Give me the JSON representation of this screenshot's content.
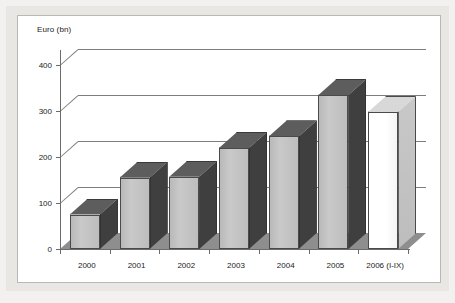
{
  "chart_data": {
    "type": "bar",
    "title": "",
    "subtitle": "",
    "xlabel": "",
    "ylabel": "Euro (bn)",
    "categories": [
      "2000",
      "2001",
      "2002",
      "2003",
      "2004",
      "2005",
      "2006 (I-IX)"
    ],
    "values": [
      75,
      155,
      157,
      220,
      245,
      335,
      298
    ],
    "series": [
      {
        "name": "Euro (bn)",
        "values": [
          75,
          155,
          157,
          220,
          245,
          335,
          298
        ]
      }
    ],
    "ylim": [
      0,
      420
    ],
    "yticks": [
      0,
      100,
      200,
      300,
      400
    ],
    "ytick_labels": [
      "0",
      "100",
      "200",
      "300",
      "400"
    ],
    "grid": true,
    "grid_axis": "y",
    "legend": false,
    "legend_position": "none",
    "style": "3d-column",
    "bar_colors": [
      "#c4c4c4",
      "#c4c4c4",
      "#c4c4c4",
      "#c4c4c4",
      "#c4c4c4",
      "#c4c4c4",
      "#ffffff"
    ],
    "highlight_last": true,
    "colors": {
      "bar_fill": "#c4c4c4",
      "bar_fill_last": "#ffffff",
      "bar_side": "#3f3f3f",
      "bar_top": "#5d5d5d",
      "floor": "#8e8e8e",
      "gridline": "#7d7d7d",
      "axis": "#6b6b6b",
      "plot_background": "#ffffff",
      "frame": "#e8e7e4",
      "text": "#1a1a1a"
    }
  },
  "axis": {
    "y_label": "Euro (bn)"
  }
}
